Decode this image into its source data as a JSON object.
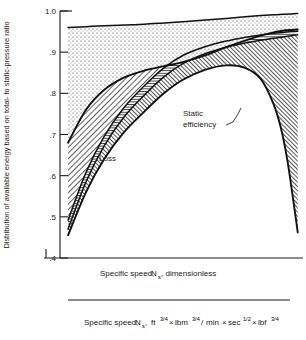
{
  "chart_data": {
    "type": "area",
    "title": "",
    "ylabel": "Distribution of available energy based on total- to static-pressure ratio",
    "xlabel": "Specific speed, N_s, dimensionless",
    "xlabel2": "Specific speed, N_s, ft^3/4 lbm^3/4 / (min sec^1/2 lbf^3/4)",
    "xscale": "log",
    "yscale": "linear",
    "ylim": [
      0.4,
      1.0
    ],
    "xlim": [
      0.1,
      1.3
    ],
    "grid": false,
    "legend_position": "inside-lower-left",
    "y_ticks": [
      "1.0",
      ".9",
      ".8",
      ".7",
      ".6",
      ".5",
      ".4"
    ],
    "y_tick_values": [
      1.0,
      0.9,
      0.8,
      0.7,
      0.6,
      0.5,
      0.4
    ],
    "x_ticks_labeled": [
      ".1",
      ".2",
      ".4",
      ".6",
      ".8",
      "1"
    ],
    "x_tick_values_labeled": [
      0.1,
      0.2,
      0.4,
      0.6,
      0.8,
      1.0
    ],
    "x_ticks_minor": [
      0.3,
      0.5,
      0.7,
      0.9,
      1.2
    ],
    "x2_ticks": [
      "20",
      "40",
      "60",
      "80",
      "100",
      "200"
    ],
    "x2_tick_values": [
      20,
      40,
      60,
      80,
      100,
      200
    ],
    "x2_lim": [
      20,
      200
    ],
    "annotations": [
      {
        "text": "Static efficiency",
        "x": 0.62,
        "y": 0.74
      }
    ],
    "series": [
      {
        "name": "Static efficiency",
        "comment": "lower boundary of exit-velocity band; the useful work fraction",
        "x": [
          0.125,
          0.15,
          0.18,
          0.22,
          0.27,
          0.33,
          0.4,
          0.5,
          0.62,
          0.75,
          0.88,
          1.0,
          1.08,
          1.15,
          1.22,
          1.28
        ],
        "values": [
          0.455,
          0.56,
          0.64,
          0.705,
          0.755,
          0.8,
          0.833,
          0.857,
          0.868,
          0.862,
          0.835,
          0.775,
          0.715,
          0.64,
          0.545,
          0.462
        ]
      },
      {
        "name": "Windage top",
        "comment": "upper boundary of the windage band",
        "x": [
          0.125,
          0.15,
          0.18,
          0.22,
          0.27,
          0.33,
          0.4,
          0.5,
          0.62,
          0.75,
          0.88,
          1.0,
          1.1,
          1.2,
          1.28
        ],
        "values": [
          0.47,
          0.585,
          0.672,
          0.742,
          0.795,
          0.84,
          0.872,
          0.896,
          0.912,
          0.922,
          0.929,
          0.934,
          0.937,
          0.94,
          0.942
        ]
      },
      {
        "name": "Clearance top",
        "comment": "upper boundary of the clearance band",
        "x": [
          0.125,
          0.15,
          0.18,
          0.22,
          0.27,
          0.33,
          0.4,
          0.5,
          0.62,
          0.75,
          0.88,
          1.0,
          1.1,
          1.2,
          1.28
        ],
        "values": [
          0.492,
          0.608,
          0.695,
          0.765,
          0.818,
          0.862,
          0.892,
          0.913,
          0.927,
          0.936,
          0.942,
          0.946,
          0.948,
          0.95,
          0.951
        ]
      },
      {
        "name": "Rotor top",
        "comment": "upper boundary of the rotor-loss band",
        "x": [
          0.125,
          0.15,
          0.18,
          0.22,
          0.27,
          0.33,
          0.4,
          0.5,
          0.62,
          0.75,
          0.88,
          1.0,
          1.1,
          1.2,
          1.28
        ],
        "values": [
          0.68,
          0.76,
          0.808,
          0.838,
          0.855,
          0.866,
          0.876,
          0.892,
          0.912,
          0.928,
          0.94,
          0.948,
          0.952,
          0.954,
          0.955
        ]
      },
      {
        "name": "Stator top",
        "comment": "upper boundary of the stator-loss band = 1 minus stator loss",
        "x": [
          0.125,
          0.15,
          0.18,
          0.22,
          0.27,
          0.33,
          0.4,
          0.5,
          0.62,
          0.75,
          0.88,
          1.0,
          1.1,
          1.2,
          1.28
        ],
        "values": [
          0.96,
          0.962,
          0.964,
          0.966,
          0.968,
          0.971,
          0.974,
          0.978,
          0.982,
          0.986,
          0.989,
          0.991,
          0.992,
          0.993,
          0.994
        ]
      }
    ],
    "bands": [
      {
        "name": "Exit velocity",
        "pattern": "coarse-dots",
        "between": [
          "baseline",
          "Static efficiency"
        ]
      },
      {
        "name": "Windage",
        "pattern": "dense-diagonal",
        "between": [
          "Static efficiency",
          "Windage top"
        ]
      },
      {
        "name": "Clearance",
        "pattern": "horizontal-lines",
        "between": [
          "Windage top",
          "Clearance top"
        ]
      },
      {
        "name": "Rotor",
        "pattern": "diagonal-hatch",
        "between": [
          "Clearance top",
          "Rotor top"
        ]
      },
      {
        "name": "Stator",
        "pattern": "fine-dots",
        "between": [
          "Rotor top",
          "Stator top"
        ]
      }
    ]
  },
  "axes": {
    "y_label": "Distribution of available energy based on total- to static-pressure ratio",
    "y_ticks": [
      "1.0",
      ".9",
      ".8",
      ".7",
      ".6",
      ".5",
      ".4"
    ],
    "x_ticks": [
      ".1",
      ".2",
      ".4",
      ".6",
      ".8",
      "1"
    ],
    "x_label_prefix": "Specific speed,",
    "x_label_symbol": "N",
    "x_label_symbol_sub": "s",
    "x_label_suffix": ", dimensionless",
    "x2_ticks": [
      "20",
      "40",
      "60",
      "80",
      "100",
      "200"
    ],
    "x2_label_prefix": "Specific speed,",
    "x2_label_symbol": "N",
    "x2_label_symbol_sub": "s",
    "x2_unit_ft": "ft",
    "x2_unit_ft_exp": "3/4",
    "x2_unit_lbm": "lbm",
    "x2_unit_lbm_exp": "3/4",
    "x2_unit_min": "min",
    "x2_unit_sec": "sec",
    "x2_unit_sec_exp": "1/2",
    "x2_unit_lbf": "lbf",
    "x2_unit_lbf_exp": "3/4"
  },
  "legend": {
    "title": "Loss",
    "items": [
      {
        "label": "Stator",
        "pattern": "fine-dots"
      },
      {
        "label": "Rotor",
        "pattern": "diagonal-hatch"
      },
      {
        "label": "Clearance",
        "pattern": "horizontal-lines"
      },
      {
        "label": "Windage",
        "pattern": "dense-diagonal"
      },
      {
        "label": "Exit velocity",
        "pattern": "coarse-dots"
      }
    ]
  },
  "annotation": {
    "static_efficiency_line1": "Static",
    "static_efficiency_line2": "efficiency"
  },
  "colors": {
    "ink": "#1a1a1a",
    "paper": "#ffffff"
  }
}
